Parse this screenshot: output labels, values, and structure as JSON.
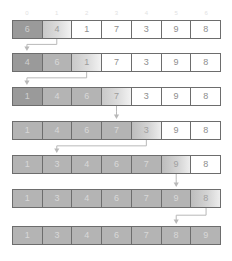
{
  "figure": {
    "cell_count": 7,
    "colors": {
      "border": "#6d6d6d",
      "sorted_fill": "#b4b4b4",
      "dark_fill": "#9a9a9a",
      "plain_fill": "#ffffff",
      "index_text": "#e2e2e2",
      "value_text": "#8e8e8e",
      "arrow": "#b9b9b9"
    }
  },
  "index_labels": [
    "0",
    "1",
    "2",
    "3",
    "4",
    "5",
    "6"
  ],
  "rows": [
    {
      "name": "step-1",
      "top": 20,
      "values": [
        "6",
        "4",
        "1",
        "7",
        "3",
        "9",
        "8"
      ],
      "states": [
        "s-dark",
        "s-active",
        "s-plain",
        "s-plain",
        "s-plain",
        "s-plain",
        "s-plain"
      ]
    },
    {
      "name": "step-2",
      "top": 53,
      "values": [
        "4",
        "6",
        "1",
        "7",
        "3",
        "9",
        "8"
      ],
      "states": [
        "s-dark",
        "s-sorted",
        "s-active",
        "s-plain",
        "s-plain",
        "s-plain",
        "s-plain"
      ]
    },
    {
      "name": "step-3",
      "top": 87,
      "values": [
        "1",
        "4",
        "6",
        "7",
        "3",
        "9",
        "8"
      ],
      "states": [
        "s-dark",
        "s-sorted",
        "s-sorted",
        "s-active",
        "s-plain",
        "s-plain",
        "s-plain"
      ]
    },
    {
      "name": "step-4",
      "top": 121,
      "values": [
        "1",
        "4",
        "6",
        "7",
        "3",
        "9",
        "8"
      ],
      "states": [
        "s-sorted",
        "s-sorted",
        "s-sorted",
        "s-sorted",
        "s-fade",
        "s-plain",
        "s-plain"
      ]
    },
    {
      "name": "step-5",
      "top": 155,
      "values": [
        "1",
        "3",
        "4",
        "6",
        "7",
        "9",
        "8"
      ],
      "states": [
        "s-sorted",
        "s-sorted",
        "s-sorted",
        "s-sorted",
        "s-sorted",
        "s-fade",
        "s-plain"
      ]
    },
    {
      "name": "step-6",
      "top": 189,
      "values": [
        "1",
        "3",
        "4",
        "6",
        "7",
        "9",
        "8"
      ],
      "states": [
        "s-sorted",
        "s-sorted",
        "s-sorted",
        "s-sorted",
        "s-sorted",
        "s-sorted",
        "s-fade"
      ]
    },
    {
      "name": "step-7",
      "top": 226,
      "values": [
        "1",
        "3",
        "4",
        "6",
        "7",
        "8",
        "9"
      ],
      "states": [
        "s-sorted",
        "s-sorted",
        "s-sorted",
        "s-sorted",
        "s-sorted",
        "s-sorted",
        "s-sorted"
      ]
    }
  ],
  "arrows": [
    {
      "name": "arrow-step1-to-step2",
      "from_index": 1,
      "to_index": 0,
      "from_row": 0,
      "to_row": 1
    },
    {
      "name": "arrow-step2-to-step3",
      "from_index": 2,
      "to_index": 0,
      "from_row": 1,
      "to_row": 2
    },
    {
      "name": "arrow-step3-to-step4",
      "from_index": 3,
      "to_index": 3,
      "from_row": 2,
      "to_row": 3
    },
    {
      "name": "arrow-step4-to-step5",
      "from_index": 4,
      "to_index": 1,
      "from_row": 3,
      "to_row": 4
    },
    {
      "name": "arrow-step5-to-step6",
      "from_index": 5,
      "to_index": 5,
      "from_row": 4,
      "to_row": 5
    },
    {
      "name": "arrow-step6-to-step7",
      "from_index": 6,
      "to_index": 5,
      "from_row": 5,
      "to_row": 6
    }
  ]
}
